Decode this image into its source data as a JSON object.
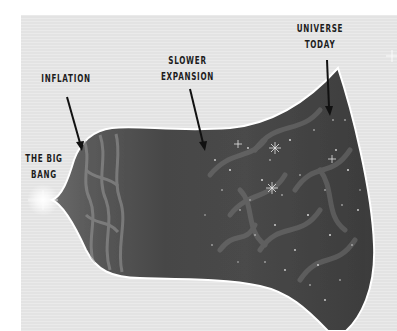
{
  "diagram": {
    "labels": {
      "big_bang": [
        "THE BIG",
        "BANG"
      ],
      "inflation": [
        "INFLATION"
      ],
      "slower_expansion": [
        "SLOWER",
        "EXPANSION"
      ],
      "universe_today": [
        "UNIVERSE",
        "TODAY"
      ]
    },
    "colors": {
      "background": "#e3e3e3",
      "universe_dark": "#3e3e3e",
      "universe_mid": "#555555",
      "outline": "#ffffff",
      "text": "#1c1c1c",
      "arrow": "#111111",
      "glow": "#ffffff"
    },
    "stages": [
      {
        "name": "The Big Bang",
        "x": 43
      },
      {
        "name": "Inflation",
        "x": 82
      },
      {
        "name": "Slower expansion",
        "x": 205
      },
      {
        "name": "Universe today",
        "x": 330
      }
    ]
  }
}
